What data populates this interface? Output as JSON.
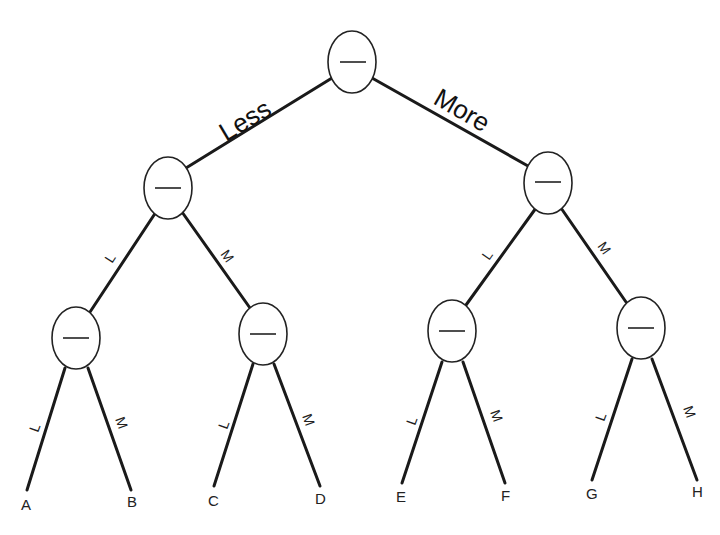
{
  "diagram": {
    "type": "binary-decision-tree",
    "root_branch_labels": {
      "left": "Less",
      "right": "More"
    },
    "sub_branch_labels": {
      "left": "L",
      "right": "M"
    },
    "node_symbol": "—",
    "nodes": [
      {
        "id": "root",
        "symbol": "—"
      },
      {
        "id": "L",
        "symbol": "—"
      },
      {
        "id": "M",
        "symbol": "—"
      },
      {
        "id": "LL",
        "symbol": "—"
      },
      {
        "id": "LM",
        "symbol": "—"
      },
      {
        "id": "ML",
        "symbol": "—"
      },
      {
        "id": "MM",
        "symbol": "—"
      }
    ],
    "leaves": [
      "A",
      "B",
      "C",
      "D",
      "E",
      "F",
      "G",
      "H"
    ]
  }
}
